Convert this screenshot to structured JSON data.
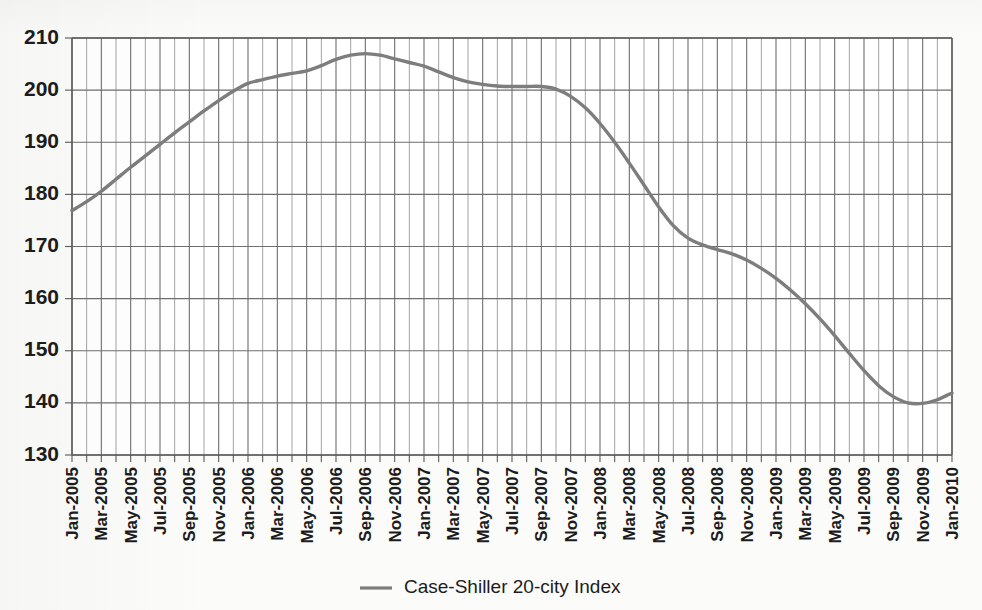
{
  "chart_data": {
    "type": "line",
    "title": "",
    "xlabel": "",
    "ylabel": "",
    "ylim": [
      130,
      210
    ],
    "y_ticks": [
      130,
      140,
      150,
      160,
      170,
      180,
      190,
      200,
      210
    ],
    "grid": true,
    "legend_position": "bottom-center",
    "series": [
      {
        "name": "Case-Shiller 20-city Index",
        "color": "#7d7d7d",
        "values": [
          176.9,
          178.6,
          180.6,
          182.9,
          185.2,
          187.4,
          189.6,
          191.8,
          193.9,
          196.0,
          198.0,
          199.8,
          201.3,
          202.0,
          202.7,
          203.2,
          203.7,
          204.7,
          205.9,
          206.7,
          207.0,
          206.7,
          206.0,
          205.3,
          204.6,
          203.5,
          202.4,
          201.6,
          201.1,
          200.8,
          200.7,
          200.7,
          200.7,
          200.2,
          198.8,
          196.6,
          193.6,
          190.0,
          186.0,
          181.8,
          177.6,
          174.0,
          171.6,
          170.3,
          169.4,
          168.6,
          167.4,
          165.8,
          163.9,
          161.6,
          159.0,
          156.1,
          152.9,
          149.5,
          146.2,
          143.3,
          141.2,
          140.0,
          139.9,
          140.6,
          141.9,
          143.4,
          144.8,
          146.0,
          146.8,
          147.1,
          147.0,
          146.7,
          146.3,
          145.9
        ]
      }
    ],
    "x": [
      "Jan-2005",
      "Feb-2005",
      "Mar-2005",
      "Apr-2005",
      "May-2005",
      "Jun-2005",
      "Jul-2005",
      "Aug-2005",
      "Sep-2005",
      "Oct-2005",
      "Nov-2005",
      "Dec-2005",
      "Jan-2006",
      "Feb-2006",
      "Mar-2006",
      "Apr-2006",
      "May-2006",
      "Jun-2006",
      "Jul-2006",
      "Aug-2006",
      "Sep-2006",
      "Oct-2006",
      "Nov-2006",
      "Dec-2006",
      "Jan-2007",
      "Feb-2007",
      "Mar-2007",
      "Apr-2007",
      "May-2007",
      "Jun-2007",
      "Jul-2007",
      "Aug-2007",
      "Sep-2007",
      "Oct-2007",
      "Nov-2007",
      "Dec-2007",
      "Jan-2008",
      "Feb-2008",
      "Mar-2008",
      "Apr-2008",
      "May-2008",
      "Jun-2008",
      "Jul-2008",
      "Aug-2008",
      "Sep-2008",
      "Oct-2008",
      "Nov-2008",
      "Dec-2008",
      "Jan-2009",
      "Feb-2009",
      "Mar-2009",
      "Apr-2009",
      "May-2009",
      "Jun-2009",
      "Jul-2009",
      "Aug-2009",
      "Sep-2009",
      "Oct-2009",
      "Nov-2009",
      "Dec-2009",
      "Jan-2010",
      "Feb-2010",
      "Mar-2010",
      "Apr-2010",
      "May-2010",
      "Jun-2010",
      "Jul-2010",
      "Aug-2010",
      "Sep-2010",
      "Oct-2010"
    ],
    "x_tick_labels": [
      "Jan-2005",
      "Mar-2005",
      "May-2005",
      "Jul-2005",
      "Sep-2005",
      "Nov-2005",
      "Jan-2006",
      "Mar-2006",
      "May-2006",
      "Jul-2006",
      "Sep-2006",
      "Nov-2006",
      "Jan-2007",
      "Mar-2007",
      "May-2007",
      "Jul-2007",
      "Sep-2007",
      "Nov-2007",
      "Jan-2008",
      "Mar-2008",
      "May-2008",
      "Jul-2008",
      "Sep-2008",
      "Nov-2008",
      "Jan-2009",
      "Mar-2009",
      "May-2009",
      "Jul-2009",
      "Sep-2009",
      "Nov-2009",
      "Jan-2010"
    ]
  },
  "legend": {
    "entries": [
      {
        "label": "Case-Shiller 20-city Index",
        "color": "#7d7d7d"
      }
    ]
  }
}
